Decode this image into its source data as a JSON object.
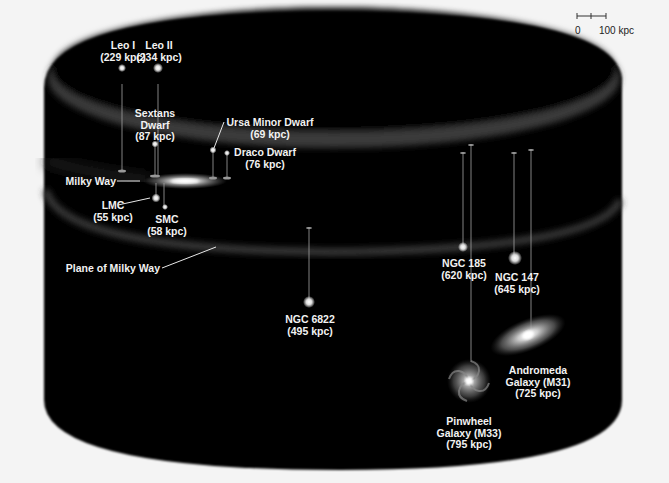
{
  "diagram": {
    "colors": {
      "background": "#f4f4f4",
      "cylinder": "#050505",
      "rim": "#3a3a3a",
      "label": "#f2f2f2"
    }
  },
  "scale_bar": {
    "zero": "0",
    "max": "100 kpc"
  },
  "labels": {
    "leo1": {
      "name": "Leo I",
      "dist": "(229 kpc)"
    },
    "leo2": {
      "name": "Leo II",
      "dist": "(234 kpc)"
    },
    "sextans": {
      "name1": "Sextans",
      "name2": "Dwarf",
      "dist": "(87 kpc)"
    },
    "ursa": {
      "name": "Ursa Minor Dwarf",
      "dist": "(69 kpc)"
    },
    "draco": {
      "name": "Draco Dwarf",
      "dist": "(76 kpc)"
    },
    "milkyway": {
      "name": "Milky Way"
    },
    "lmc": {
      "name": "LMC",
      "dist": "(55 kpc)"
    },
    "smc": {
      "name": "SMC",
      "dist": "(58 kpc)"
    },
    "plane": {
      "name": "Plane of Milky Way"
    },
    "ngc6822": {
      "name": "NGC 6822",
      "dist": "(495 kpc)"
    },
    "ngc185": {
      "name": "NGC 185",
      "dist": "(620 kpc)"
    },
    "ngc147": {
      "name": "NGC 147",
      "dist": "(645 kpc)"
    },
    "andromeda": {
      "name1": "Andromeda",
      "name2": "Galaxy (M31)",
      "dist": "(725 kpc)"
    },
    "pinwheel": {
      "name1": "Pinwheel",
      "name2": "Galaxy (M33)",
      "dist": "(795 kpc)"
    }
  }
}
